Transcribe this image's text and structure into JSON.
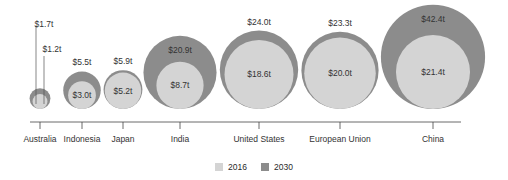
{
  "chart_data": {
    "type": "bubble",
    "title": "",
    "xlabel": "",
    "ylabel": "",
    "categories": [
      "Australia",
      "Indonesia",
      "Japan",
      "India",
      "United States",
      "European Union",
      "China"
    ],
    "series": [
      {
        "name": "2016",
        "color": "#d4d4d4",
        "values": [
          1.2,
          3.0,
          5.2,
          8.7,
          18.6,
          20.0,
          21.4
        ]
      },
      {
        "name": "2030",
        "color": "#8c8c8c",
        "values": [
          1.7,
          5.5,
          5.9,
          20.9,
          24.0,
          23.3,
          42.4
        ]
      }
    ],
    "value_labels_2016": [
      "$1.2t",
      "$3.0t",
      "$5.2t",
      "$8.7t",
      "$18.6t",
      "$20.0t",
      "$21.4t"
    ],
    "value_labels_2030": [
      "$1.7t",
      "$5.5t",
      "$5.9t",
      "$20.9t",
      "$24.0t",
      "$23.3t",
      "$42.4t"
    ],
    "legend_position": "bottom",
    "grid": false
  },
  "legend": {
    "items": [
      {
        "label": "2016",
        "color": "#d4d4d4"
      },
      {
        "label": "2030",
        "color": "#8c8c8c"
      }
    ]
  }
}
